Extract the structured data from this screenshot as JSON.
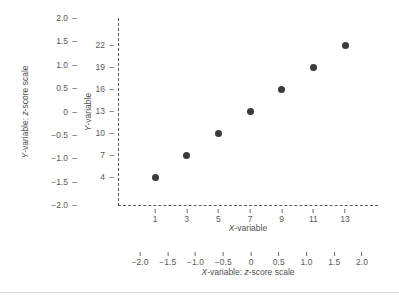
{
  "chart_data": {
    "type": "scatter",
    "title": "",
    "x": [
      1,
      3,
      5,
      7,
      9,
      11,
      13
    ],
    "values": [
      4,
      7,
      10,
      13,
      16,
      19,
      22
    ],
    "series": [
      {
        "name": "observations",
        "points": [
          {
            "x": 1,
            "y": 4
          },
          {
            "x": 3,
            "y": 7
          },
          {
            "x": 5,
            "y": 10
          },
          {
            "x": 7,
            "y": 13
          },
          {
            "x": 9,
            "y": 16
          },
          {
            "x": 11,
            "y": 19
          },
          {
            "x": 13,
            "y": 22
          }
        ]
      }
    ],
    "xlabel": "X-variable",
    "ylabel": "Y-variable",
    "xlabel_secondary": "X-variable: z-score scale",
    "ylabel_secondary": "Y-variable: z-score scale",
    "xlim": [
      1,
      13
    ],
    "ylim": [
      4,
      22
    ],
    "xlim_zscore": [
      -2.0,
      2.0
    ],
    "ylim_zscore": [
      -2.0,
      2.0
    ],
    "grid": false,
    "legend": "none",
    "marker_color": "#3a3a3a",
    "axis_color": "#5a5a5a",
    "axis_style": "dashed",
    "x_ticks": [
      "1",
      "3",
      "5",
      "7",
      "9",
      "11",
      "13"
    ],
    "y_ticks": [
      "4",
      "7",
      "10",
      "13",
      "16",
      "19",
      "22"
    ],
    "x_ticks_zscore": [
      "−2.0",
      "−1.5",
      "−1.0",
      "−0.5",
      "0",
      "0.5",
      "1.0",
      "1.5",
      "2.0"
    ],
    "y_ticks_zscore": [
      "2.0",
      "1.5",
      "1.0",
      "0.5",
      "0",
      "−0.5",
      "−1.0",
      "−1.5",
      "−2.0"
    ]
  },
  "axis_titles": {
    "x_inner_prefix": "X",
    "x_inner_suffix": "-variable",
    "y_inner_prefix": "Y",
    "y_inner_suffix": "-variable",
    "x_outer_prefix": "X",
    "x_outer_mid": "-variable: ",
    "x_outer_z": "z",
    "x_outer_suffix": "-score scale",
    "y_outer_prefix": "Y",
    "y_outer_mid": "-variable: ",
    "y_outer_z": "z",
    "y_outer_suffix": "-score scale"
  },
  "tick_dash": "–"
}
